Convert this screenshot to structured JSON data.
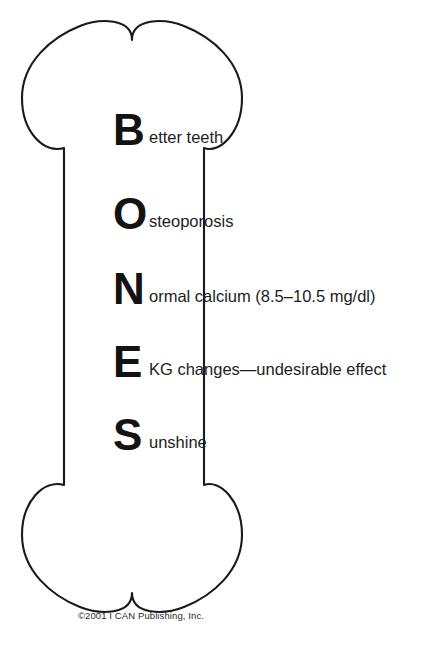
{
  "figure": {
    "shape_name": "bone-outline",
    "outline_color": "#1a1a1a",
    "fill_color": "#ffffff",
    "text_color": "#1d1d1d"
  },
  "mnemonic": {
    "word": "BONES",
    "rows": [
      {
        "letter": "B",
        "text": "etter teeth",
        "full": "Better teeth"
      },
      {
        "letter": "O",
        "text": "steoporosis",
        "full": "Osteoporosis"
      },
      {
        "letter": "N",
        "text": "ormal calcium (8.5–10.5 mg/dl)",
        "full": "Normal calcium (8.5–10.5 mg/dl)"
      },
      {
        "letter": "E",
        "text": "KG changes—undesirable effect",
        "full": "EKG changes—undesirable effect"
      },
      {
        "letter": "S",
        "text": "unshine",
        "full": "Sunshine"
      }
    ]
  },
  "footer": {
    "copyright": "©2001 I CAN Publishing, Inc."
  }
}
